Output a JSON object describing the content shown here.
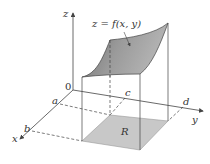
{
  "diagram": {
    "surface_label": "z = f(x, y)",
    "region_label": "R",
    "axes": {
      "z": "z",
      "x": "x",
      "y": "y",
      "origin": "0"
    },
    "ticks": {
      "a": "a",
      "b": "b",
      "c": "c",
      "d": "d"
    },
    "colors": {
      "surface": "#8a8a8a",
      "region": "#c8c8c8",
      "lines": "#444444"
    }
  }
}
